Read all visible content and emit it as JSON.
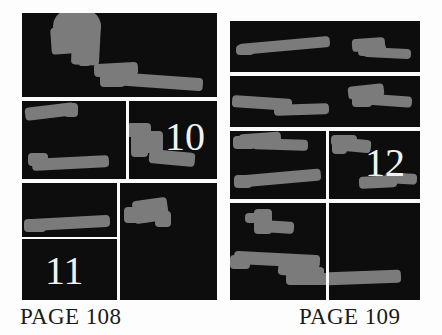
{
  "spread": {
    "title": "Comic book page layout thumbnails",
    "colors": {
      "paper": "#fdfdfd",
      "panel_fill": "#0d0d0d",
      "art_gray": "#7b7b7b",
      "gutter": "#fbfbfb",
      "caption_text": "#1a1a1a",
      "panel_number_text": "#f2f2f2"
    }
  },
  "pages": [
    {
      "id": "page-left",
      "caption": "PAGE 108",
      "panel_count": 6,
      "panels": [
        {
          "id": "L1",
          "number": "",
          "row": 1,
          "span": "full"
        },
        {
          "id": "L2",
          "number": "",
          "row": 2,
          "span": "left"
        },
        {
          "id": "L3",
          "number": "10",
          "row": 2,
          "span": "right"
        },
        {
          "id": "L4",
          "number": "",
          "row": 3,
          "span": "left-top"
        },
        {
          "id": "L5",
          "number": "11",
          "row": 4,
          "span": "left-bottom"
        },
        {
          "id": "L6",
          "number": "",
          "row": 3,
          "span": "right-tall"
        }
      ]
    },
    {
      "id": "page-right",
      "caption": "PAGE 109",
      "panel_count": 6,
      "panels": [
        {
          "id": "R1",
          "number": "",
          "row": 1,
          "span": "full"
        },
        {
          "id": "R2",
          "number": "",
          "row": 2,
          "span": "full"
        },
        {
          "id": "R3",
          "number": "",
          "row": 3,
          "span": "left"
        },
        {
          "id": "R4",
          "number": "12",
          "row": 3,
          "span": "right"
        },
        {
          "id": "R5",
          "number": "",
          "row": 4,
          "span": "left"
        },
        {
          "id": "R6",
          "number": "",
          "row": 4,
          "span": "right"
        }
      ]
    }
  ],
  "captions": {
    "left": "PAGE 108",
    "right": "PAGE 109"
  },
  "panel_numbers": {
    "ten": "10",
    "eleven": "11",
    "twelve": "12"
  }
}
